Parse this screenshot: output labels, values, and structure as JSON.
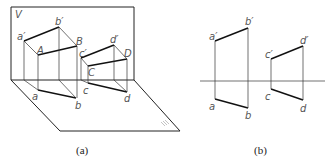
{
  "figure_a": {
    "caption": "(a)",
    "plane_v_label": "V",
    "plane_h_label": "H",
    "labels": {
      "a_prime": "a′",
      "b_prime": "b′",
      "A": "A",
      "B": "B",
      "a": "a",
      "b": "b",
      "c_prime": "c′",
      "d_prime": "d′",
      "C": "C",
      "D": "D",
      "c": "c",
      "d": "d"
    }
  },
  "figure_b": {
    "caption": "(b)",
    "labels": {
      "a_prime": "a′",
      "b_prime": "b′",
      "a": "a",
      "b": "b",
      "c_prime": "c′",
      "d_prime": "d′",
      "c": "c",
      "d": "d"
    }
  }
}
